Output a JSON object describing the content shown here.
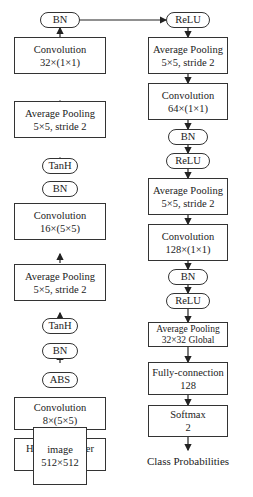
{
  "diagram": {
    "left_column": [
      {
        "id": "bn3",
        "type": "pill",
        "lines": [
          "BN"
        ]
      },
      {
        "id": "conv3",
        "type": "rect",
        "lines": [
          "Convolution",
          "32×(1×1)"
        ]
      },
      {
        "id": "pool2",
        "type": "rect",
        "lines": [
          "Average Pooling",
          "5×5, stride 2"
        ]
      },
      {
        "id": "tanh2",
        "type": "pill",
        "lines": [
          "TanH"
        ]
      },
      {
        "id": "bn2",
        "type": "pill",
        "lines": [
          "BN"
        ]
      },
      {
        "id": "conv2",
        "type": "rect",
        "lines": [
          "Convolution",
          "16×(5×5)"
        ]
      },
      {
        "id": "pool1",
        "type": "rect",
        "lines": [
          "Average Pooling",
          "5×5, stride 2"
        ]
      },
      {
        "id": "tanh1",
        "type": "pill",
        "lines": [
          "TanH"
        ]
      },
      {
        "id": "bn1",
        "type": "pill",
        "lines": [
          "BN"
        ]
      },
      {
        "id": "abs",
        "type": "pill",
        "lines": [
          "ABS"
        ]
      },
      {
        "id": "conv1",
        "type": "rect",
        "lines": [
          "Convolution",
          "8×(5×5)"
        ]
      },
      {
        "id": "hpf",
        "type": "rect",
        "lines": [
          "High-pass Filter",
          "5×5"
        ]
      },
      {
        "id": "image",
        "type": "rect",
        "lines": [
          "image",
          "512×512"
        ]
      }
    ],
    "right_column": [
      {
        "id": "relu1",
        "type": "pill",
        "lines": [
          "ReLU"
        ]
      },
      {
        "id": "pool3",
        "type": "rect",
        "lines": [
          "Average Pooling",
          "5×5, stride 2"
        ]
      },
      {
        "id": "conv4",
        "type": "rect",
        "lines": [
          "Convolution",
          "64×(1×1)"
        ]
      },
      {
        "id": "bn4",
        "type": "pill",
        "lines": [
          "BN"
        ]
      },
      {
        "id": "relu2",
        "type": "pill",
        "lines": [
          "ReLU"
        ]
      },
      {
        "id": "pool4",
        "type": "rect",
        "lines": [
          "Average Pooling",
          "5×5, stride 2"
        ]
      },
      {
        "id": "conv5",
        "type": "rect",
        "lines": [
          "Convolution",
          "128×(1×1)"
        ]
      },
      {
        "id": "bn5",
        "type": "pill",
        "lines": [
          "BN"
        ]
      },
      {
        "id": "relu3",
        "type": "pill",
        "lines": [
          "ReLU"
        ]
      },
      {
        "id": "gpool",
        "type": "rect",
        "lines": [
          "Average Pooling",
          "32×32 Global"
        ]
      },
      {
        "id": "fc",
        "type": "rect",
        "lines": [
          "Fully-connection",
          "128"
        ]
      },
      {
        "id": "softmax",
        "type": "rect",
        "lines": [
          "Softmax",
          "2"
        ]
      }
    ],
    "output_label": "Class Probabilities",
    "edges_note": "left column flows bottom-to-top (image → BN); BN connects right to ReLU; right column flows top-to-bottom to Class Probabilities"
  }
}
